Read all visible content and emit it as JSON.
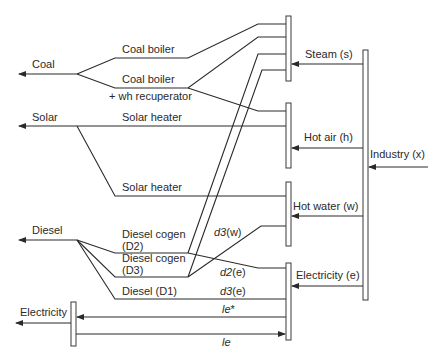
{
  "diagram": {
    "sources": {
      "coal": "Coal",
      "solar": "Solar",
      "diesel": "Diesel",
      "electricity": "Electricity"
    },
    "technologies": {
      "coal_boiler": "Coal boiler",
      "coal_boiler_wh_line1": "Coal boiler",
      "coal_boiler_wh_line2": "+ wh recuperator",
      "solar_heater_1": "Solar heater",
      "solar_heater_2": "Solar heater",
      "diesel_cogen_d2_line1": "Diesel cogen",
      "diesel_cogen_d2_line2": "(D2)",
      "diesel_cogen_d3_line1": "Diesel cogen",
      "diesel_cogen_d3_line2": "(D3)",
      "diesel_d1": "Diesel (D1)"
    },
    "demands": {
      "steam": "Steam (s)",
      "hot_air": "Hot air (h)",
      "hot_water": "Hot water (w)",
      "electricity": "Electricity (e)",
      "industry": "Industry (x)"
    },
    "flow_labels": {
      "d3w_var": "d3",
      "d3w_sub": "(w)",
      "d2e_var": "d2",
      "d2e_sub": "(e)",
      "d3e_var": "d3",
      "d3e_sub": "(e)",
      "le_star_var": "le",
      "le_star_sub": "*",
      "le_var": "le"
    },
    "colors": {
      "line": "#2a2a2a",
      "background": "#ffffff"
    }
  }
}
